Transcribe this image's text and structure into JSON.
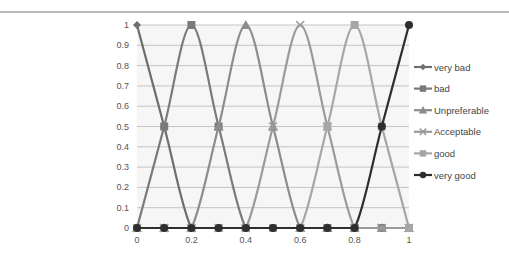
{
  "chart_data": {
    "type": "line",
    "title": "",
    "xlabel": "",
    "ylabel": "",
    "x": [
      0,
      0.1,
      0.2,
      0.3,
      0.4,
      0.5,
      0.6,
      0.7,
      0.8,
      0.9,
      1
    ],
    "x_ticks": [
      "0",
      "0.2",
      "0.4",
      "0.6",
      "0.8",
      "1"
    ],
    "y_ticks": [
      "0",
      "0.1",
      "0.2",
      "0.3",
      "0.4",
      "0.5",
      "0.6",
      "0.7",
      "0.8",
      "0.9",
      "1"
    ],
    "xlim": [
      0,
      1
    ],
    "ylim": [
      0,
      1
    ],
    "grid": true,
    "legend_position": "right",
    "smoothed": true,
    "series": [
      {
        "name": "very bad",
        "marker": "diamond",
        "color": "#6e6e6e",
        "values": [
          1,
          0.5,
          0,
          0,
          0,
          0,
          0,
          0,
          0,
          0,
          0
        ]
      },
      {
        "name": "bad",
        "marker": "square",
        "color": "#7a7a7a",
        "values": [
          0,
          0.5,
          1,
          0.5,
          0,
          0,
          0,
          0,
          0,
          0,
          0
        ]
      },
      {
        "name": "Unpreferable",
        "marker": "triangle",
        "color": "#8c8c8c",
        "values": [
          0,
          0,
          0,
          0.5,
          1,
          0.5,
          0,
          0,
          0,
          0,
          0
        ]
      },
      {
        "name": "Acceptable",
        "marker": "x",
        "color": "#9a9a9a",
        "values": [
          0,
          0,
          0,
          0,
          0,
          0.5,
          1,
          0.5,
          0,
          0,
          0
        ]
      },
      {
        "name": "good",
        "marker": "square",
        "color": "#a6a6a6",
        "values": [
          0,
          0,
          0,
          0,
          0,
          0,
          0,
          0.5,
          1,
          0.5,
          0
        ]
      },
      {
        "name": "very good",
        "marker": "circle",
        "color": "#2e2e2e",
        "values": [
          0,
          0,
          0,
          0,
          0,
          0,
          0,
          0,
          0,
          0.5,
          1
        ]
      }
    ]
  }
}
